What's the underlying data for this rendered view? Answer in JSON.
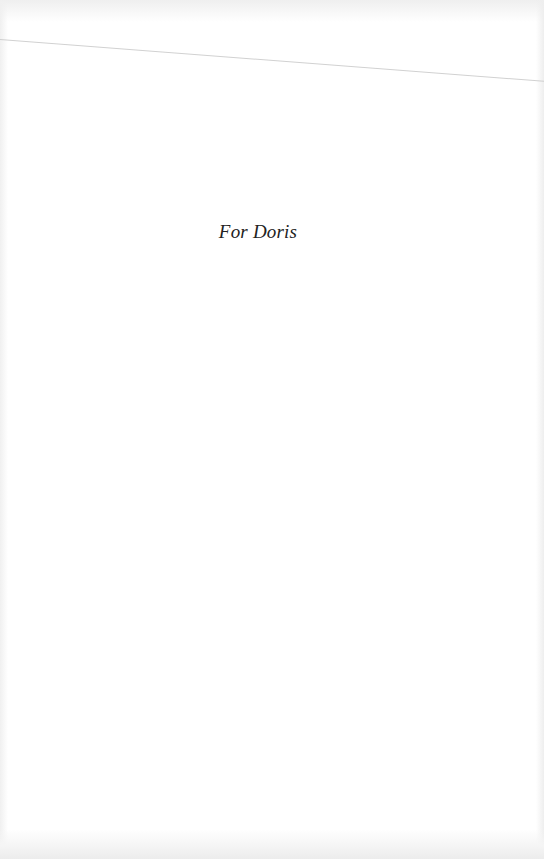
{
  "page": {
    "dedication": "For Doris"
  },
  "colors": {
    "background": "#ffffff",
    "text": "#222222",
    "scan_line": "#c9c9c9"
  }
}
